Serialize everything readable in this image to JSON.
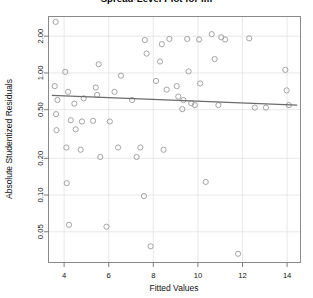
{
  "chart_data": {
    "type": "scatter",
    "title": "Spread-Level Plot for lm",
    "xlabel": "Fitted Values",
    "ylabel": "Absolute Studentized Residuals",
    "xlim": [
      3.3,
      14.6
    ],
    "ylim": [
      0.028,
      2.9
    ],
    "yscale": "log",
    "xscale": "linear",
    "grid": true,
    "legend": null,
    "xticks": [
      4,
      6,
      8,
      10,
      12,
      14
    ],
    "xtick_labels": [
      "4",
      "6",
      "8",
      "10",
      "12",
      "14"
    ],
    "yticks": [
      0.05,
      0.1,
      0.2,
      0.5,
      1.0,
      2.0
    ],
    "ytick_labels": [
      "0.05",
      "0.10",
      "0.20",
      "0.50",
      "1.00",
      "2.00"
    ],
    "marker": "open-circle",
    "marker_color": "#9a9a9a",
    "trendline": {
      "label": "smooth fit",
      "color": "#6b6b6b",
      "x": [
        3.45,
        14.45
      ],
      "y": [
        0.655,
        0.545
      ]
    },
    "points": [
      {
        "x": 3.62,
        "y": 2.62
      },
      {
        "x": 3.58,
        "y": 0.78
      },
      {
        "x": 3.7,
        "y": 0.6
      },
      {
        "x": 3.64,
        "y": 0.46
      },
      {
        "x": 3.66,
        "y": 0.34
      },
      {
        "x": 4.05,
        "y": 1.02
      },
      {
        "x": 4.18,
        "y": 0.7
      },
      {
        "x": 4.46,
        "y": 0.56
      },
      {
        "x": 4.3,
        "y": 0.41
      },
      {
        "x": 4.52,
        "y": 0.345
      },
      {
        "x": 4.1,
        "y": 0.245
      },
      {
        "x": 4.12,
        "y": 0.125
      },
      {
        "x": 4.22,
        "y": 0.057
      },
      {
        "x": 4.88,
        "y": 0.62
      },
      {
        "x": 4.8,
        "y": 0.4
      },
      {
        "x": 4.74,
        "y": 0.235
      },
      {
        "x": 5.55,
        "y": 1.18
      },
      {
        "x": 5.42,
        "y": 0.76
      },
      {
        "x": 5.48,
        "y": 0.66
      },
      {
        "x": 5.3,
        "y": 0.405
      },
      {
        "x": 5.62,
        "y": 0.205
      },
      {
        "x": 5.9,
        "y": 0.055
      },
      {
        "x": 6.26,
        "y": 0.7
      },
      {
        "x": 6.05,
        "y": 0.4
      },
      {
        "x": 6.55,
        "y": 0.95
      },
      {
        "x": 6.42,
        "y": 0.245
      },
      {
        "x": 7.05,
        "y": 0.6
      },
      {
        "x": 7.25,
        "y": 0.205
      },
      {
        "x": 7.62,
        "y": 1.86
      },
      {
        "x": 7.7,
        "y": 1.44
      },
      {
        "x": 7.42,
        "y": 0.245
      },
      {
        "x": 7.58,
        "y": 0.098
      },
      {
        "x": 7.88,
        "y": 0.038
      },
      {
        "x": 8.38,
        "y": 1.72
      },
      {
        "x": 8.3,
        "y": 1.24
      },
      {
        "x": 8.12,
        "y": 0.86
      },
      {
        "x": 8.46,
        "y": 0.235
      },
      {
        "x": 8.72,
        "y": 1.9
      },
      {
        "x": 8.6,
        "y": 0.73
      },
      {
        "x": 9.05,
        "y": 0.78
      },
      {
        "x": 9.12,
        "y": 0.64
      },
      {
        "x": 9.35,
        "y": 0.6
      },
      {
        "x": 9.3,
        "y": 0.505
      },
      {
        "x": 9.52,
        "y": 1.9
      },
      {
        "x": 9.58,
        "y": 1.03
      },
      {
        "x": 9.7,
        "y": 0.565
      },
      {
        "x": 9.86,
        "y": 0.545
      },
      {
        "x": 10.05,
        "y": 1.88
      },
      {
        "x": 10.1,
        "y": 0.82
      },
      {
        "x": 10.35,
        "y": 0.128
      },
      {
        "x": 10.62,
        "y": 2.08
      },
      {
        "x": 10.75,
        "y": 1.3
      },
      {
        "x": 10.92,
        "y": 0.545
      },
      {
        "x": 11.05,
        "y": 1.96
      },
      {
        "x": 11.22,
        "y": 1.88
      },
      {
        "x": 11.8,
        "y": 0.033
      },
      {
        "x": 12.3,
        "y": 1.92
      },
      {
        "x": 12.55,
        "y": 0.52
      },
      {
        "x": 13.05,
        "y": 0.52
      },
      {
        "x": 13.92,
        "y": 1.06
      },
      {
        "x": 13.98,
        "y": 0.72
      },
      {
        "x": 14.08,
        "y": 0.545
      }
    ]
  }
}
